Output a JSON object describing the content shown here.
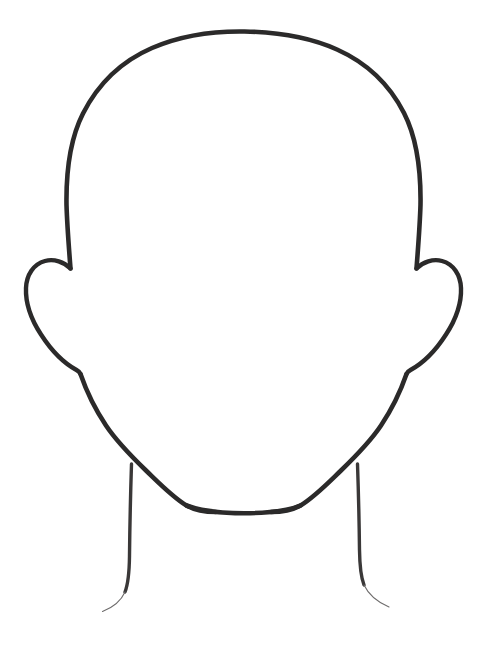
{
  "document": {
    "title": "Blank Face Outline Template",
    "kind": "line-drawing",
    "subject": "human head front view outline",
    "background_color": "#ffffff",
    "stroke_color": "#2b2a2a",
    "faint_stroke_color": "#6e6c6c",
    "canvas": {
      "width": 489,
      "height": 649
    }
  },
  "drawing": {
    "style": {
      "fill": "none",
      "main_stroke_width": 4.6,
      "ear_stroke_width": 4.4,
      "neck_stroke_width": 3.4,
      "neck_tail_stroke_width": 1.1,
      "line_cap": "round",
      "line_join": "round"
    },
    "parts": [
      {
        "id": "head-cranium-jaw",
        "label": "Head outline (cranium, temples and jaw)",
        "path": "M 70.5 268.5 C 68.5 243 67.0 222 66.5 205 C 66.0 170 70.5 138 83.0 113.5 C 98.0 84.0 122.0 61.0 152.0 48.0 C 182.0 35.0 214.0 31.0 244.5 31.5 C 275.5 32.0 308.0 36.5 337.0 49.5 C 366.0 62.5 389.5 84.5 404.0 113.0 C 416.5 137.5 421.0 169.5 420.5 204.5 C 420.0 222 418.5 243 416.5 268.5"
      },
      {
        "id": "jaw-left",
        "label": "Left jaw line from ear to chin",
        "path": "M 80.5 374.0 C 86.0 390.0 95.0 409.0 106.0 425.5 C 116.0 440.5 130.0 455.0 146.0 470.5 C 160.0 484.0 172.5 497.0 186.5 505.5 C 196.0 511.0 206.0 512.0 216.0 512.0"
      },
      {
        "id": "jaw-right",
        "label": "Right jaw line from ear to chin",
        "path": "M 406.5 374.0 C 401.0 390.0 392.0 409.0 381.0 425.5 C 371.0 440.5 357.0 455.0 341.0 470.5 C 327.0 484.0 314.5 497.0 300.5 505.5 C 291.0 511.0 281.0 512.0 271.0 512.0"
      },
      {
        "id": "chin-bottom",
        "label": "Flat chin base",
        "path": "M 186.5 505.5 C 205.0 512.5 230.0 513.2 244.0 513.2 C 262.0 513.2 285.0 512.0 300.5 505.5"
      },
      {
        "id": "ear-left",
        "label": "Left ear",
        "path": "M 70.5 268.5 C 64.0 262.0 54.0 258.5 45.0 261.0 C 33.5 264.0 26.5 275.0 26.0 288.0 C 25.4 303.5 31.5 320.0 41.0 334.5 C 51.0 350.0 64.5 363.5 76.5 370.0 C 79.5 371.6 80.0 373.0 80.5 374.0"
      },
      {
        "id": "ear-right",
        "label": "Right ear",
        "path": "M 416.5 268.5 C 423.0 262.0 433.0 258.5 442.0 261.0 C 453.5 264.0 460.5 275.0 461.0 288.0 C 461.6 303.5 455.5 320.0 446.0 334.5 C 436.0 350.0 422.5 363.5 410.5 370.0 C 407.5 371.6 407.0 373.0 406.5 374.0"
      },
      {
        "id": "neck-left",
        "label": "Left neck line",
        "path": "M 131.5 464.0 C 130.5 495.0 129.8 528.0 129.5 556.0 C 129.3 572.0 128.5 583.0 125.0 592.0"
      },
      {
        "id": "neck-left-tail",
        "label": "Left neck line tapering tail",
        "path": "M 125.0 592.0 C 121.0 601.0 114.0 607.0 102.5 611.5"
      },
      {
        "id": "neck-right",
        "label": "Right neck line",
        "path": "M 357.5 464.0 C 358.5 493.0 359.2 524.0 359.5 550.0 C 359.7 565.0 360.5 576.0 364.0 585.0"
      },
      {
        "id": "neck-right-tail",
        "label": "Right neck line tapering tail",
        "path": "M 364.0 585.0 C 368.5 594.5 376.0 601.5 389.0 607.0"
      }
    ]
  },
  "accessibility": {
    "alt_text": "Blank outline drawing of a human head facing forward, with ears and neck, and no facial features."
  }
}
